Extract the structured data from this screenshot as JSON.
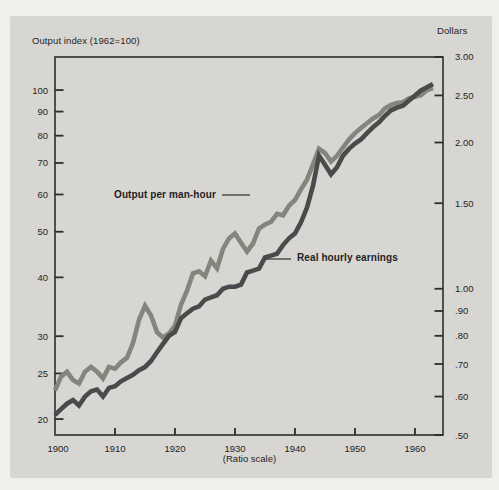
{
  "annotations": {
    "series1_label": "Output per man-hour",
    "series2_label": "Real hourly earnings"
  },
  "colors": {
    "page_background": "#f1efeb",
    "panel_background": "#d7d6d2",
    "axis": "#2d2d2b",
    "text": "#1f1f1f",
    "output_line": "#85847d",
    "earnings_line": "#4a4a4c"
  },
  "chart_data": {
    "type": "line",
    "scale": "log (ratio scale), dual y-axes",
    "title": "",
    "x_axis": {
      "caption": "(Ratio scale)",
      "ticks": [
        1900,
        1910,
        1920,
        1930,
        1940,
        1950,
        1960
      ],
      "range": [
        1900,
        1964.7
      ]
    },
    "left_axis": {
      "title": "Output index (1962=100)",
      "ticks": [
        100,
        90,
        80,
        70,
        60,
        50,
        40,
        30,
        25,
        20
      ],
      "tick_labels": [
        "100",
        "90",
        "80",
        "70",
        "60",
        "50",
        "40",
        "30",
        "25",
        "20"
      ],
      "range": [
        18.5,
        117.5
      ]
    },
    "right_axis": {
      "title": "Dollars",
      "ticks": [
        3.0,
        2.5,
        2.0,
        1.5,
        1.0,
        0.9,
        0.8,
        0.7,
        0.6,
        0.5
      ],
      "tick_labels": [
        "3.00",
        "2.50",
        "2.00",
        "1.50",
        "1.00",
        ".90",
        ".80",
        ".70",
        ".60",
        ".50"
      ],
      "range": [
        0.5,
        3.0
      ]
    },
    "x": [
      1900,
      1901,
      1902,
      1903,
      1904,
      1905,
      1906,
      1907,
      1908,
      1909,
      1910,
      1911,
      1912,
      1913,
      1914,
      1915,
      1916,
      1917,
      1918,
      1919,
      1920,
      1921,
      1922,
      1923,
      1924,
      1925,
      1926,
      1927,
      1928,
      1929,
      1930,
      1931,
      1932,
      1933,
      1934,
      1935,
      1936,
      1937,
      1938,
      1939,
      1940,
      1941,
      1942,
      1943,
      1944,
      1945,
      1946,
      1947,
      1948,
      1949,
      1950,
      1951,
      1952,
      1953,
      1954,
      1955,
      1956,
      1957,
      1958,
      1959,
      1960,
      1961,
      1962,
      1963
    ],
    "series": [
      {
        "name": "Output per man-hour",
        "axis": "left",
        "units": "index, 1962=100",
        "color": "#85847d",
        "values": [
          23.0,
          24.6,
          25.2,
          24.2,
          23.8,
          25.2,
          25.8,
          25.2,
          24.4,
          25.8,
          25.6,
          26.4,
          27.0,
          29.0,
          32.5,
          34.8,
          33.2,
          30.6,
          29.8,
          30.4,
          31.6,
          35.0,
          37.5,
          40.8,
          41.2,
          40.2,
          43.4,
          41.8,
          46.0,
          48.4,
          49.6,
          47.4,
          45.4,
          47.2,
          50.8,
          51.8,
          52.5,
          54.6,
          54.2,
          56.8,
          58.4,
          61.5,
          64.5,
          69.5,
          75.0,
          73.5,
          70.5,
          72.5,
          75.5,
          78.5,
          81.0,
          83.0,
          85.0,
          87.0,
          88.5,
          91.5,
          93.0,
          93.8,
          94.2,
          96.0,
          96.8,
          97.5,
          100.0,
          101.0
        ]
      },
      {
        "name": "Real hourly earnings",
        "axis": "right",
        "units": "dollars",
        "color": "#4a4a4c",
        "values": [
          0.55,
          0.565,
          0.58,
          0.59,
          0.575,
          0.6,
          0.615,
          0.62,
          0.6,
          0.625,
          0.63,
          0.645,
          0.655,
          0.665,
          0.68,
          0.69,
          0.71,
          0.74,
          0.77,
          0.8,
          0.815,
          0.87,
          0.89,
          0.91,
          0.92,
          0.95,
          0.96,
          0.97,
          1.0,
          1.01,
          1.01,
          1.02,
          1.08,
          1.09,
          1.1,
          1.16,
          1.17,
          1.18,
          1.23,
          1.27,
          1.3,
          1.37,
          1.47,
          1.63,
          1.88,
          1.8,
          1.72,
          1.78,
          1.88,
          1.94,
          1.99,
          2.03,
          2.09,
          2.15,
          2.2,
          2.27,
          2.33,
          2.36,
          2.38,
          2.44,
          2.5,
          2.56,
          2.6,
          2.64
        ]
      }
    ],
    "grid": false,
    "legend_position": "inline annotations with leader lines"
  }
}
